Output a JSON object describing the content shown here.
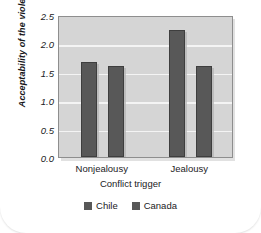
{
  "chart_data": {
    "type": "bar",
    "title": "",
    "xlabel": "Conflict trigger",
    "ylabel": "Acceptability of the violence",
    "categories": [
      "Nonjealousy",
      "Jealousy"
    ],
    "series": [
      {
        "name": "Chile",
        "values": [
          1.67,
          2.23
        ],
        "color": "#585858"
      },
      {
        "name": "Canada",
        "values": [
          1.6,
          1.6
        ],
        "color": "#585858"
      }
    ],
    "ylim": [
      0.0,
      2.5
    ],
    "yticks": [
      "0.0",
      "0.5",
      "1.0",
      "1.5",
      "2.0",
      "2.5"
    ],
    "ytick_values": [
      0.0,
      0.5,
      1.0,
      1.5,
      2.0,
      2.5
    ],
    "grid": "horizontal",
    "legend_position": "bottom",
    "plot_background": "#d5d5d5",
    "gridline_color": "#f4f4f4"
  }
}
